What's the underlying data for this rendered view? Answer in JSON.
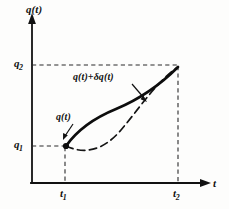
{
  "figure": {
    "background_color": "#fdfdfc",
    "ink_color": "#111111",
    "axes": {
      "y_axis_label": "q(t)",
      "x_axis_label": "t",
      "y_axis_x_px": 32,
      "x_axis_y_px": 183,
      "arrowheads": [
        "y-up",
        "x-right"
      ]
    },
    "ticks": {
      "q2": {
        "base": "q",
        "sub": "2",
        "value_px_y": 65
      },
      "q1": {
        "base": "q",
        "sub": "1",
        "value_px_y": 146
      },
      "t1": {
        "base": "t",
        "sub": "1",
        "value_px_x": 65
      },
      "t2": {
        "base": "t",
        "sub": "2",
        "value_px_x": 178
      }
    },
    "guides": {
      "style": "dashed",
      "color": "#333333",
      "lines": [
        {
          "name": "q2-horizontal",
          "from": [
            32,
            65
          ],
          "to": [
            178,
            65
          ]
        },
        {
          "name": "q1-horizontal",
          "from": [
            32,
            146
          ],
          "to": [
            65,
            146
          ]
        },
        {
          "name": "t1-vertical",
          "from": [
            65,
            146
          ],
          "to": [
            65,
            183
          ]
        },
        {
          "name": "t2-vertical",
          "from": [
            178,
            68
          ],
          "to": [
            178,
            183
          ]
        }
      ]
    },
    "endpoints": [
      {
        "name": "start-point",
        "x": 65,
        "y": 146,
        "marker": "filled-dot"
      },
      {
        "name": "end-point",
        "x": 178,
        "y": 67,
        "marker": "none"
      }
    ],
    "curves": [
      {
        "name": "true-path",
        "label": "q(t)",
        "style": "solid",
        "stroke_width": 2.6,
        "description": "bold solid S-curve bowing above the chord near the left half"
      },
      {
        "name": "varied-path",
        "label": "q(t)+δq(t)",
        "style": "dashed",
        "stroke_width": 1.6,
        "description": "dashed S-curve bowing below the chord near the left half, crossing the solid curve in the middle"
      }
    ],
    "annotations": [
      {
        "name": "varied-path-annotation",
        "text": "q(t)+δq(t)",
        "leader": {
          "from": [
            133,
            85
          ],
          "to": [
            146,
            100
          ]
        }
      },
      {
        "name": "true-path-annotation",
        "text": "q(t)",
        "leader": {
          "from": [
            72,
            124
          ],
          "to": [
            63,
            137
          ]
        }
      }
    ]
  }
}
